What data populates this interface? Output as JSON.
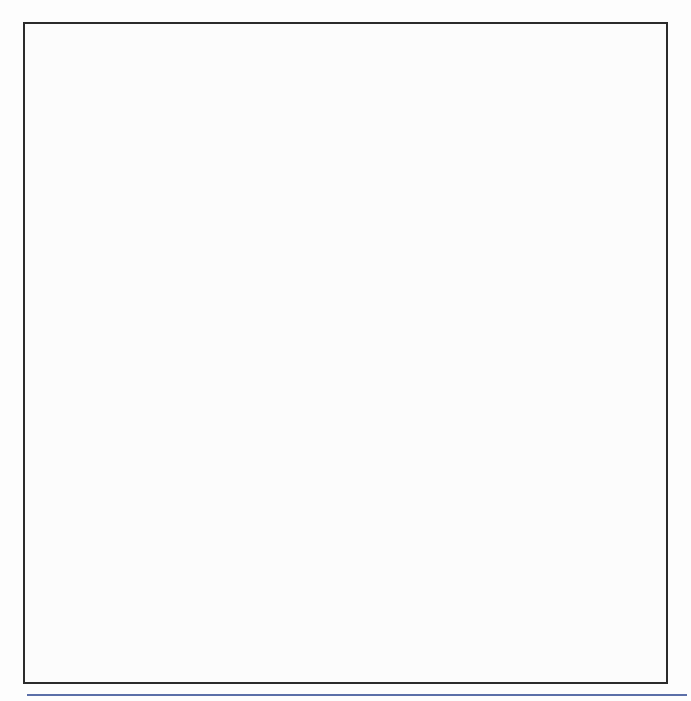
{
  "figure": {
    "accent_rule_color": "#5b6fa8",
    "frame_color": "#2b2b2b"
  },
  "legend": {
    "series_us_label": "United States",
    "series_mi_label": "Michigan",
    "us_color": "#0d0d0d",
    "mi_color": "#8d8d8d",
    "position": "top-right-inside"
  },
  "chart_data": [
    {
      "type": "line",
      "panel": "top",
      "title": "Number of persons involved in manufacturing",
      "xlabel": "Year",
      "ylabel": "United States (x 100,000)",
      "y2label": "Michigan (x 100,000)",
      "grid": true,
      "xlim": [
        1953,
        2006
      ],
      "ylim": [
        100,
        250
      ],
      "y2lim": [
        6,
        15
      ],
      "yticks": [
        100,
        150,
        200,
        250
      ],
      "y2ticks": [
        6,
        9,
        12,
        15
      ],
      "xticks": [
        1955,
        1960,
        1965,
        1970,
        1975,
        1980,
        1985,
        1990,
        1995,
        2000,
        2005
      ],
      "xticklabels": [
        "1955",
        "1960",
        "1965",
        "1970",
        "1975",
        "1980",
        "1985",
        "1990",
        "1995",
        "2000",
        "2005"
      ],
      "gridline_colors": {
        "200": "#6a6ab8",
        "150": "#6b5a5a",
        "12": "#6b5a5a",
        "9": "#6b5a5a"
      },
      "series": [
        {
          "name": "United States",
          "axis": "left",
          "unit": "x 100,000",
          "x": [
            1954,
            1956,
            1958,
            1960,
            1962,
            1964,
            1966,
            1968,
            1969,
            1970,
            1971,
            1972,
            1973,
            1974,
            1975,
            1976,
            1977,
            1978,
            1979,
            1980,
            1981,
            1982,
            1983,
            1984,
            1985,
            1986,
            1987,
            1988,
            1989,
            1990,
            1991,
            1992,
            1993,
            1994,
            1995,
            1996,
            1997,
            1998,
            1999,
            2000,
            2001,
            2002,
            2003,
            2004,
            2005
          ],
          "y": [
            173,
            170,
            160,
            164,
            167,
            177,
            190,
            193,
            201,
            202,
            190,
            194,
            204,
            202,
            187,
            195,
            200,
            207,
            213,
            208,
            194,
            194,
            194,
            194,
            194,
            194,
            194,
            194,
            194,
            194,
            183,
            186,
            188,
            189,
            189,
            189,
            186,
            180,
            173,
            169,
            161,
            152,
            147,
            142,
            139
          ]
        },
        {
          "name": "Michigan",
          "axis": "right",
          "unit": "x 100,000",
          "x": [
            1954,
            1956,
            1958,
            1960,
            1962,
            1964,
            1966,
            1968,
            1969,
            1970,
            1971,
            1972,
            1973,
            1974,
            1975,
            1976,
            1977,
            1978,
            1979,
            1980,
            1981,
            1982,
            1983,
            1984,
            1985,
            1986,
            1987,
            1988,
            1989,
            1990,
            1991,
            1992,
            1993,
            1994,
            1995,
            1996,
            1997,
            1998,
            1999,
            2000,
            2001,
            2002,
            2003,
            2004,
            2005
          ],
          "y": [
            12.7,
            11.6,
            9.1,
            9.0,
            9.3,
            10.6,
            11.7,
            11.5,
            11.8,
            11.6,
            11.2,
            11.2,
            11.8,
            11.5,
            10.4,
            11.2,
            11.6,
            11.8,
            11.6,
            9.0,
            9.0,
            8.9,
            9.3,
            10.0,
            9.8,
            9.6,
            10.1,
            9.8,
            9.7,
            9.6,
            9.0,
            9.4,
            9.6,
            9.8,
            9.6,
            9.7,
            9.8,
            9.6,
            9.9,
            9.7,
            8.0,
            7.5,
            7.0,
            6.6,
            6.4
          ]
        }
      ]
    },
    {
      "type": "line",
      "panel": "bottom",
      "title": "Percent of total employees involved in manufacturing",
      "xlabel": "Year",
      "ylabel": "Percentage",
      "grid": true,
      "xlim": [
        1953,
        2006
      ],
      "ylim": [
        10,
        60
      ],
      "yticks": [
        10,
        20,
        30,
        40,
        50,
        60
      ],
      "yticklabels": [
        "10%",
        "20%",
        "30%",
        "40%",
        "50%",
        "60%"
      ],
      "xticks": [
        1955,
        1960,
        1965,
        1970,
        1975,
        1980,
        1985,
        1990,
        1995,
        2000,
        2005
      ],
      "xticklabels": [
        "1955",
        "1960",
        "1965",
        "1970",
        "1975",
        "1980",
        "1985",
        "1990",
        "1995",
        "2000",
        "2005"
      ],
      "series": [
        {
          "name": "United States",
          "x": [
            1954,
            1956,
            1958,
            1960,
            1962,
            1964,
            1966,
            1968,
            1969,
            1970,
            1971,
            1972,
            1973,
            1974,
            1975,
            1976,
            1977,
            1978,
            1979,
            1980,
            1981,
            1982,
            1983,
            1984,
            1985,
            1986,
            1987,
            1988,
            1989,
            1990,
            1991,
            1992,
            1993,
            1994,
            1995,
            1996,
            1997,
            1998,
            1999,
            2000,
            2001,
            2002,
            2003,
            2004,
            2005
          ],
          "y": [
            43.2,
            41.6,
            38.4,
            37.6,
            37.2,
            36.8,
            35.4,
            34.6,
            34.4,
            33.4,
            32.4,
            32.3,
            32.2,
            31.0,
            29.4,
            29.4,
            29.3,
            28.4,
            27.4,
            26.3,
            25.8,
            24.8,
            23.8,
            23.4,
            22.6,
            22.0,
            21.4,
            21.2,
            21.0,
            20.0,
            19.0,
            18.2,
            17.6,
            17.2,
            16.6,
            15.8,
            15.0,
            14.6,
            14.0,
            13.6,
            13.2,
            13.0,
            12.9,
            12.8,
            12.8
          ]
        },
        {
          "name": "Michigan",
          "x": [
            1954,
            1956,
            1958,
            1960,
            1962,
            1964,
            1966,
            1968,
            1969,
            1970,
            1971,
            1972,
            1973,
            1974,
            1975,
            1976,
            1977,
            1978,
            1979,
            1980,
            1981,
            1982,
            1983,
            1984,
            1985,
            1986,
            1987,
            1988,
            1989,
            1990,
            1991,
            1992,
            1993,
            1994,
            1995,
            1996,
            1997,
            1998,
            1999,
            2000,
            2001,
            2002,
            2003,
            2004,
            2005
          ],
          "y": [
            59.6,
            55.0,
            51.6,
            49.4,
            49.6,
            49.2,
            48.4,
            47.6,
            47.4,
            44.6,
            43.0,
            42.0,
            41.0,
            40.4,
            37.8,
            37.4,
            37.0,
            36.0,
            34.6,
            34.4,
            32.4,
            31.8,
            29.6,
            28.2,
            27.6,
            27.6,
            27.4,
            27.0,
            27.0,
            25.4,
            25.4,
            25.6,
            22.0,
            21.4,
            20.6,
            20.0,
            19.6,
            19.2,
            18.6,
            18.0,
            17.6,
            17.4,
            17.4,
            17.4,
            17.3
          ]
        }
      ]
    }
  ]
}
